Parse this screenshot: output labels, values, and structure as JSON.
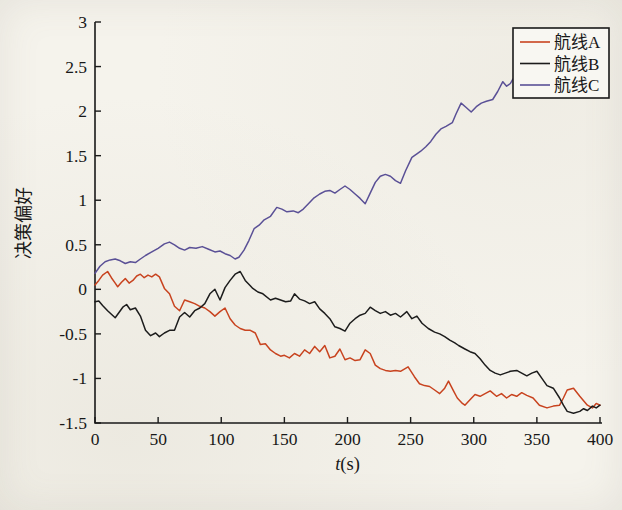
{
  "figure": {
    "background": "#f5f3ec",
    "axis_color": "#1a1a1a",
    "legend": {
      "position": "top-right",
      "border_color": "#1a1a1a",
      "background": "#f8f7f2"
    }
  },
  "chart_data": {
    "type": "line",
    "title": "",
    "xlabel": "t(s)",
    "xlabel_var": "t",
    "xlabel_unit": "(s)",
    "ylabel": "决策偏好",
    "xlim": [
      0,
      400
    ],
    "ylim": [
      -1.5,
      3
    ],
    "xtick_labels": [
      "0",
      "50",
      "100",
      "150",
      "200",
      "250",
      "300",
      "350",
      "400"
    ],
    "xtick_values": [
      0,
      50,
      100,
      150,
      200,
      250,
      300,
      350,
      400
    ],
    "ytick_labels": [
      "-1.5",
      "-1",
      "-0.5",
      "0",
      "0.5",
      "1",
      "1.5",
      "2",
      "2.5",
      "3"
    ],
    "ytick_values": [
      -1.5,
      -1,
      -0.5,
      0,
      0.5,
      1,
      1.5,
      2,
      2.5,
      3
    ],
    "grid": false,
    "legend_position": "top-right",
    "legend_entries": [
      "航线A",
      "航线B",
      "航线C"
    ],
    "series": [
      {
        "name": "航线A",
        "color": "#c8431f",
        "points": [
          [
            0,
            0.05
          ],
          [
            3,
            0.1
          ],
          [
            6,
            0.16
          ],
          [
            10,
            0.2
          ],
          [
            13,
            0.13
          ],
          [
            16,
            0.07
          ],
          [
            18,
            0.03
          ],
          [
            21,
            0.08
          ],
          [
            24,
            0.12
          ],
          [
            27,
            0.07
          ],
          [
            30,
            0.1
          ],
          [
            33,
            0.15
          ],
          [
            36,
            0.17
          ],
          [
            39,
            0.13
          ],
          [
            42,
            0.16
          ],
          [
            45,
            0.14
          ],
          [
            48,
            0.17
          ],
          [
            51,
            0.14
          ],
          [
            55,
            0.01
          ],
          [
            59,
            -0.05
          ],
          [
            63,
            -0.19
          ],
          [
            67,
            -0.24
          ],
          [
            71,
            -0.12
          ],
          [
            75,
            -0.14
          ],
          [
            79,
            -0.16
          ],
          [
            83,
            -0.19
          ],
          [
            87,
            -0.21
          ],
          [
            91,
            -0.25
          ],
          [
            95,
            -0.3
          ],
          [
            99,
            -0.25
          ],
          [
            103,
            -0.21
          ],
          [
            107,
            -0.33
          ],
          [
            111,
            -0.4
          ],
          [
            115,
            -0.44
          ],
          [
            119,
            -0.46
          ],
          [
            123,
            -0.46
          ],
          [
            127,
            -0.49
          ],
          [
            131,
            -0.62
          ],
          [
            135,
            -0.61
          ],
          [
            139,
            -0.68
          ],
          [
            143,
            -0.72
          ],
          [
            147,
            -0.75
          ],
          [
            150,
            -0.74
          ],
          [
            154,
            -0.77
          ],
          [
            158,
            -0.72
          ],
          [
            162,
            -0.75
          ],
          [
            166,
            -0.68
          ],
          [
            170,
            -0.72
          ],
          [
            174,
            -0.64
          ],
          [
            178,
            -0.7
          ],
          [
            182,
            -0.63
          ],
          [
            186,
            -0.77
          ],
          [
            190,
            -0.75
          ],
          [
            194,
            -0.67
          ],
          [
            198,
            -0.79
          ],
          [
            202,
            -0.77
          ],
          [
            206,
            -0.8
          ],
          [
            210,
            -0.79
          ],
          [
            214,
            -0.68
          ],
          [
            218,
            -0.72
          ],
          [
            222,
            -0.85
          ],
          [
            226,
            -0.89
          ],
          [
            230,
            -0.91
          ],
          [
            234,
            -0.92
          ],
          [
            238,
            -0.91
          ],
          [
            242,
            -0.92
          ],
          [
            248,
            -0.87
          ],
          [
            253,
            -0.98
          ],
          [
            257,
            -1.06
          ],
          [
            261,
            -1.08
          ],
          [
            265,
            -1.09
          ],
          [
            269,
            -1.13
          ],
          [
            273,
            -1.17
          ],
          [
            277,
            -1.11
          ],
          [
            280,
            -1.03
          ],
          [
            284,
            -1.14
          ],
          [
            287,
            -1.22
          ],
          [
            291,
            -1.28
          ],
          [
            293,
            -1.3
          ],
          [
            297,
            -1.24
          ],
          [
            301,
            -1.18
          ],
          [
            305,
            -1.2
          ],
          [
            309,
            -1.17
          ],
          [
            313,
            -1.14
          ],
          [
            318,
            -1.2
          ],
          [
            322,
            -1.17
          ],
          [
            326,
            -1.22
          ],
          [
            330,
            -1.18
          ],
          [
            334,
            -1.2
          ],
          [
            338,
            -1.16
          ],
          [
            342,
            -1.19
          ],
          [
            347,
            -1.22
          ],
          [
            352,
            -1.3
          ],
          [
            358,
            -1.33
          ],
          [
            363,
            -1.31
          ],
          [
            368,
            -1.3
          ],
          [
            371,
            -1.22
          ],
          [
            374,
            -1.13
          ],
          [
            379,
            -1.11
          ],
          [
            384,
            -1.2
          ],
          [
            390,
            -1.3
          ],
          [
            394,
            -1.33
          ],
          [
            397,
            -1.28
          ],
          [
            400,
            -1.3
          ]
        ]
      },
      {
        "name": "航线B",
        "color": "#1c1c1c",
        "points": [
          [
            0,
            -0.14
          ],
          [
            3,
            -0.13
          ],
          [
            6,
            -0.18
          ],
          [
            10,
            -0.24
          ],
          [
            13,
            -0.28
          ],
          [
            16,
            -0.32
          ],
          [
            19,
            -0.26
          ],
          [
            22,
            -0.2
          ],
          [
            25,
            -0.17
          ],
          [
            28,
            -0.23
          ],
          [
            32,
            -0.21
          ],
          [
            36,
            -0.3
          ],
          [
            40,
            -0.46
          ],
          [
            44,
            -0.52
          ],
          [
            48,
            -0.49
          ],
          [
            51,
            -0.53
          ],
          [
            55,
            -0.49
          ],
          [
            59,
            -0.46
          ],
          [
            63,
            -0.46
          ],
          [
            67,
            -0.31
          ],
          [
            71,
            -0.26
          ],
          [
            75,
            -0.31
          ],
          [
            79,
            -0.24
          ],
          [
            83,
            -0.21
          ],
          [
            87,
            -0.16
          ],
          [
            91,
            -0.05
          ],
          [
            95,
            0
          ],
          [
            99,
            -0.12
          ],
          [
            103,
            0.02
          ],
          [
            107,
            0.1
          ],
          [
            111,
            0.17
          ],
          [
            115,
            0.2
          ],
          [
            119,
            0.1
          ],
          [
            123,
            0.04
          ],
          [
            125,
            0.01
          ],
          [
            129,
            -0.03
          ],
          [
            133,
            -0.05
          ],
          [
            139,
            -0.12
          ],
          [
            143,
            -0.1
          ],
          [
            147,
            -0.12
          ],
          [
            151,
            -0.14
          ],
          [
            155,
            -0.13
          ],
          [
            158,
            -0.05
          ],
          [
            162,
            -0.11
          ],
          [
            166,
            -0.13
          ],
          [
            170,
            -0.16
          ],
          [
            174,
            -0.14
          ],
          [
            178,
            -0.22
          ],
          [
            182,
            -0.27
          ],
          [
            186,
            -0.33
          ],
          [
            190,
            -0.42
          ],
          [
            194,
            -0.44
          ],
          [
            198,
            -0.47
          ],
          [
            202,
            -0.38
          ],
          [
            206,
            -0.33
          ],
          [
            210,
            -0.29
          ],
          [
            214,
            -0.27
          ],
          [
            218,
            -0.2
          ],
          [
            222,
            -0.24
          ],
          [
            226,
            -0.27
          ],
          [
            230,
            -0.25
          ],
          [
            234,
            -0.29
          ],
          [
            238,
            -0.27
          ],
          [
            242,
            -0.31
          ],
          [
            247,
            -0.25
          ],
          [
            251,
            -0.33
          ],
          [
            255,
            -0.3
          ],
          [
            259,
            -0.38
          ],
          [
            264,
            -0.44
          ],
          [
            269,
            -0.48
          ],
          [
            273,
            -0.5
          ],
          [
            277,
            -0.53
          ],
          [
            281,
            -0.57
          ],
          [
            285,
            -0.6
          ],
          [
            288,
            -0.63
          ],
          [
            293,
            -0.67
          ],
          [
            297,
            -0.7
          ],
          [
            301,
            -0.72
          ],
          [
            305,
            -0.78
          ],
          [
            309,
            -0.85
          ],
          [
            313,
            -0.91
          ],
          [
            317,
            -0.94
          ],
          [
            321,
            -0.96
          ],
          [
            325,
            -0.94
          ],
          [
            329,
            -0.92
          ],
          [
            334,
            -0.91
          ],
          [
            338,
            -0.94
          ],
          [
            342,
            -0.97
          ],
          [
            346,
            -0.94
          ],
          [
            350,
            -0.92
          ],
          [
            354,
            -1
          ],
          [
            358,
            -1.08
          ],
          [
            363,
            -1.11
          ],
          [
            368,
            -1.22
          ],
          [
            371,
            -1.3
          ],
          [
            374,
            -1.37
          ],
          [
            379,
            -1.39
          ],
          [
            384,
            -1.37
          ],
          [
            387,
            -1.34
          ],
          [
            390,
            -1.36
          ],
          [
            394,
            -1.31
          ],
          [
            397,
            -1.33
          ],
          [
            400,
            -1.3
          ]
        ]
      },
      {
        "name": "航线C",
        "color": "#5a5096",
        "points": [
          [
            0,
            0.18
          ],
          [
            4,
            0.26
          ],
          [
            8,
            0.31
          ],
          [
            12,
            0.33
          ],
          [
            16,
            0.34
          ],
          [
            20,
            0.32
          ],
          [
            24,
            0.29
          ],
          [
            28,
            0.31
          ],
          [
            32,
            0.3
          ],
          [
            36,
            0.34
          ],
          [
            40,
            0.38
          ],
          [
            45,
            0.42
          ],
          [
            50,
            0.46
          ],
          [
            55,
            0.51
          ],
          [
            59,
            0.53
          ],
          [
            63,
            0.5
          ],
          [
            67,
            0.46
          ],
          [
            71,
            0.44
          ],
          [
            75,
            0.47
          ],
          [
            80,
            0.46
          ],
          [
            85,
            0.48
          ],
          [
            90,
            0.45
          ],
          [
            95,
            0.42
          ],
          [
            99,
            0.43
          ],
          [
            103,
            0.4
          ],
          [
            107,
            0.38
          ],
          [
            111,
            0.34
          ],
          [
            114,
            0.36
          ],
          [
            118,
            0.44
          ],
          [
            122,
            0.55
          ],
          [
            126,
            0.68
          ],
          [
            130,
            0.72
          ],
          [
            134,
            0.78
          ],
          [
            139,
            0.82
          ],
          [
            144,
            0.92
          ],
          [
            148,
            0.9
          ],
          [
            152,
            0.87
          ],
          [
            157,
            0.88
          ],
          [
            161,
            0.86
          ],
          [
            165,
            0.9
          ],
          [
            169,
            0.96
          ],
          [
            173,
            1.02
          ],
          [
            178,
            1.07
          ],
          [
            182,
            1.1
          ],
          [
            186,
            1.11
          ],
          [
            190,
            1.08
          ],
          [
            194,
            1.12
          ],
          [
            198,
            1.16
          ],
          [
            202,
            1.12
          ],
          [
            206,
            1.07
          ],
          [
            210,
            1.02
          ],
          [
            214,
            0.96
          ],
          [
            218,
            1.08
          ],
          [
            222,
            1.2
          ],
          [
            226,
            1.27
          ],
          [
            230,
            1.29
          ],
          [
            234,
            1.27
          ],
          [
            238,
            1.22
          ],
          [
            242,
            1.19
          ],
          [
            246,
            1.33
          ],
          [
            251,
            1.48
          ],
          [
            255,
            1.52
          ],
          [
            258,
            1.55
          ],
          [
            262,
            1.6
          ],
          [
            266,
            1.66
          ],
          [
            270,
            1.74
          ],
          [
            274,
            1.8
          ],
          [
            278,
            1.83
          ],
          [
            283,
            1.87
          ],
          [
            286,
            1.97
          ],
          [
            290,
            2.09
          ],
          [
            294,
            2.04
          ],
          [
            298,
            1.99
          ],
          [
            302,
            2.05
          ],
          [
            306,
            2.09
          ],
          [
            310,
            2.11
          ],
          [
            315,
            2.13
          ],
          [
            319,
            2.22
          ],
          [
            323,
            2.33
          ],
          [
            326,
            2.28
          ],
          [
            329,
            2.31
          ],
          [
            331,
            2.36
          ]
        ]
      }
    ]
  }
}
